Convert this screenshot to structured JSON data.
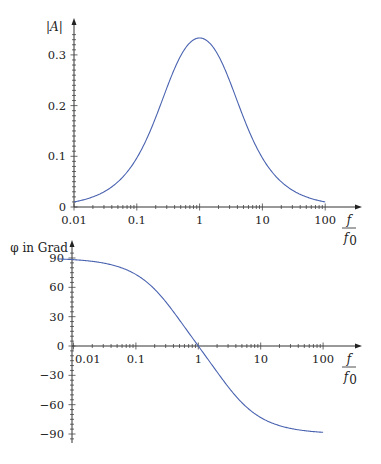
{
  "chart_data": [
    {
      "type": "line",
      "title": "",
      "xlabel": "f / f0",
      "ylabel": "|A|",
      "xscale": "log",
      "xlim": [
        0.01,
        100
      ],
      "ylim": [
        0,
        0.35
      ],
      "x_ticks": [
        "0.01",
        "0.1",
        "1",
        "10",
        "100"
      ],
      "y_ticks": [
        "0",
        "0.1",
        "0.2",
        "0.3"
      ],
      "grid": false,
      "legend": null,
      "series": [
        {
          "name": "|A|",
          "color": "#4a63b0",
          "x": [
            0.01,
            0.02,
            0.05,
            0.1,
            0.2,
            0.3,
            0.5,
            0.7,
            1,
            1.43,
            2,
            3.33,
            5,
            10,
            20,
            50,
            100
          ],
          "values": [
            0.01,
            0.02,
            0.05,
            0.097,
            0.182,
            0.243,
            0.305,
            0.327,
            0.333,
            0.327,
            0.305,
            0.243,
            0.182,
            0.097,
            0.05,
            0.02,
            0.01
          ]
        }
      ]
    },
    {
      "type": "line",
      "title": "",
      "xlabel": "f / f0",
      "ylabel": "φ in Grad",
      "xscale": "log",
      "xlim": [
        0.006,
        100
      ],
      "ylim": [
        -100,
        100
      ],
      "x_ticks": [
        "0.01",
        "0.1",
        "1",
        "10",
        "100"
      ],
      "y_ticks": [
        "90",
        "60",
        "30",
        "0",
        "-30",
        "-60",
        "-90"
      ],
      "grid": false,
      "legend": null,
      "series": [
        {
          "name": "φ",
          "color": "#4a63b0",
          "x": [
            0.006,
            0.01,
            0.02,
            0.05,
            0.1,
            0.2,
            0.3,
            0.5,
            0.7,
            1,
            1.43,
            2,
            3.33,
            5,
            10,
            20,
            50,
            100
          ],
          "values": [
            89.1,
            88.1,
            86.2,
            80.5,
            73.1,
            58.4,
            46.0,
            26.6,
            13.7,
            0,
            -13.7,
            -26.6,
            -46.0,
            -58.4,
            -73.1,
            -81.3,
            -86.5,
            -88.1
          ]
        }
      ]
    }
  ],
  "plots": {
    "top": {
      "ylabel": "|A|",
      "xlabel_num": "f",
      "xlabel_den": "f",
      "xlabel_den_sub": "0",
      "y_ticks": [
        {
          "label": "0",
          "value": 0
        },
        {
          "label": "0.1",
          "value": 0.1
        },
        {
          "label": "0.2",
          "value": 0.2
        },
        {
          "label": "0.3",
          "value": 0.3
        }
      ],
      "x_ticks": [
        {
          "label": "0.01",
          "value": 0.01
        },
        {
          "label": "0.1",
          "value": 0.1
        },
        {
          "label": "1",
          "value": 1
        },
        {
          "label": "10",
          "value": 10
        },
        {
          "label": "100",
          "value": 100
        }
      ]
    },
    "bottom": {
      "ylabel": "φ in Grad",
      "xlabel_num": "f",
      "xlabel_den": "f",
      "xlabel_den_sub": "0",
      "y_ticks": [
        {
          "label": "90",
          "value": 90
        },
        {
          "label": "60",
          "value": 60
        },
        {
          "label": "30",
          "value": 30
        },
        {
          "label": "0",
          "value": 0
        },
        {
          "label": "−30",
          "value": -30
        },
        {
          "label": "−60",
          "value": -60
        },
        {
          "label": "−90",
          "value": -90
        }
      ],
      "x_ticks": [
        {
          "label": "0.01",
          "value": 0.01
        },
        {
          "label": "0.1",
          "value": 0.1
        },
        {
          "label": "1",
          "value": 1
        },
        {
          "label": "10",
          "value": 10
        },
        {
          "label": "100",
          "value": 100
        }
      ]
    }
  }
}
